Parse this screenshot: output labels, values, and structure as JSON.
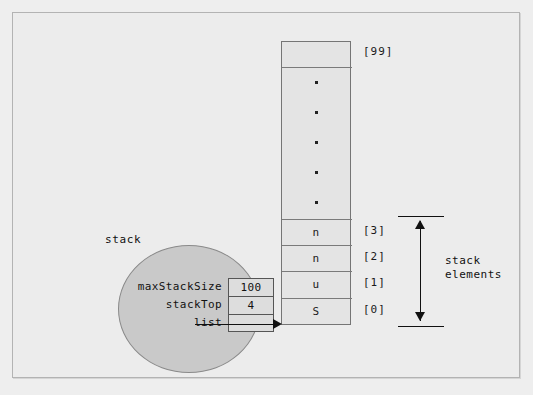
{
  "diagram": {
    "background_color": "#ececec",
    "frame_color": "#b3b3b3"
  },
  "array": {
    "top_index_label": "[99]",
    "top_cell_value": "",
    "ellipsis_dot_count": 5,
    "cells": [
      {
        "value": "n",
        "index_label": "[3]"
      },
      {
        "value": "n",
        "index_label": "[2]"
      },
      {
        "value": "u",
        "index_label": "[1]"
      },
      {
        "value": "S",
        "index_label": "[0]"
      }
    ]
  },
  "stack_object": {
    "label": "stack",
    "fields": [
      {
        "name": "maxStackSize",
        "value": "100"
      },
      {
        "name": "stackTop",
        "value": "4"
      },
      {
        "name": "list",
        "value": ""
      }
    ],
    "circle_fill": "#c9c9c9"
  },
  "annotation": {
    "bracket_label_line1": "stack",
    "bracket_label_line2": "elements"
  }
}
